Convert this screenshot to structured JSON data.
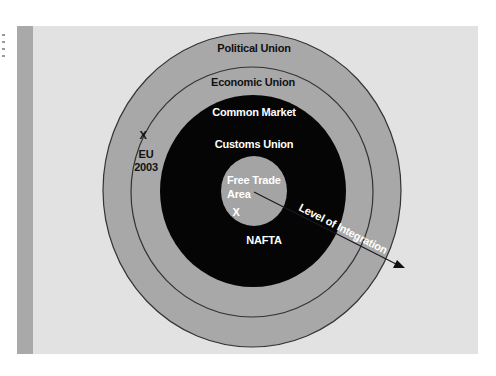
{
  "diagram": {
    "type": "concentric-circles",
    "colors": {
      "panel": "#e2e2e2",
      "stripe": "#a9a9a9",
      "outer_rings": "#a8a8a8",
      "core_dark": "#050505",
      "inner_circle": "#a4a4a4",
      "ring_line": "#333333",
      "dark_text": "#111111",
      "light_text": "#ffffff"
    },
    "rings": [
      {
        "label": "Political Union"
      },
      {
        "label": "Economic Union"
      },
      {
        "label": "Common Market"
      },
      {
        "label": "Customs Union"
      },
      {
        "label_line1": "Free Trade",
        "label_line2": "Area"
      }
    ],
    "markers": [
      {
        "symbol": "X",
        "label_line1": "EU",
        "label_line2": "2003"
      },
      {
        "symbol": "X",
        "label": "NAFTA"
      }
    ],
    "arrow": {
      "label": "Level of Integration"
    }
  }
}
